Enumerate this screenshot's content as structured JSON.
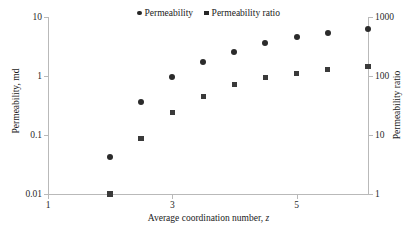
{
  "chart_data": {
    "type": "scatter",
    "title": "",
    "xlabel": "Average coordination number, z",
    "ylabel": "Permeability, md",
    "y2label": "Permeability ratio",
    "xlim": [
      1,
      6.15
    ],
    "ylim": [
      0.01,
      10
    ],
    "y2lim": [
      1,
      1000
    ],
    "yscale": "log",
    "y2scale": "log",
    "grid": false,
    "legend_position": "top-center",
    "xticks": [
      "1",
      "3",
      "5"
    ],
    "xtick_values": [
      1,
      3,
      5
    ],
    "yticks": [
      "0.01",
      "0.1",
      "1",
      "10"
    ],
    "ytick_values": [
      0.01,
      0.1,
      1,
      10
    ],
    "y2ticks": [
      "1",
      "10",
      "100",
      "1000"
    ],
    "y2tick_values": [
      1,
      10,
      100,
      1000
    ],
    "series": [
      {
        "name": "Permeability",
        "marker": "circle",
        "color": "#2b2b2b",
        "axis": "left",
        "x": [
          2,
          2.5,
          3,
          3.5,
          4,
          4.5,
          5,
          5.5,
          6.15
        ],
        "y": [
          0.042,
          0.36,
          0.95,
          1.75,
          2.6,
          3.6,
          4.6,
          5.4,
          6.3
        ]
      },
      {
        "name": "Permeability ratio",
        "marker": "square",
        "color": "#3a3a3a",
        "axis": "right",
        "x": [
          2,
          2.5,
          3,
          3.5,
          4,
          4.5,
          5,
          5.5,
          6.15
        ],
        "y": [
          1.0,
          8.8,
          24,
          45,
          72,
          95,
          110,
          128,
          145
        ]
      }
    ]
  },
  "legend": {
    "items": [
      {
        "label": "Permeability",
        "marker": "circle"
      },
      {
        "label": "Permeability ratio",
        "marker": "square"
      }
    ]
  },
  "axes": {
    "x_title": "Average coordination number, ",
    "x_title_italic": "z",
    "y_left_title": "Permeability, md",
    "y_right_title": "Permeability ratio"
  }
}
